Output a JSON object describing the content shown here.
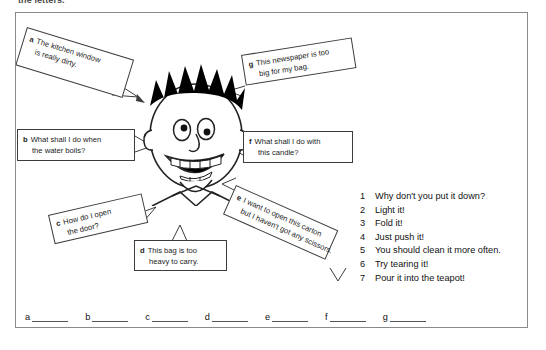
{
  "worksheet": {
    "top_instruction": "the letters.",
    "bubbles": [
      {
        "tag": "a",
        "line1": "The kitchen window",
        "line2": "is really dirty."
      },
      {
        "tag": "b",
        "line1": "What shall I do when",
        "line2": "the water boils?"
      },
      {
        "tag": "c",
        "line1": "How do I open",
        "line2": "the door?"
      },
      {
        "tag": "d",
        "line1": "This bag is too",
        "line2": "heavy to carry."
      },
      {
        "tag": "e",
        "line1": "I want to open this carton",
        "line2": "but I haven't got any scissors."
      },
      {
        "tag": "f",
        "line1": "What shall I do with",
        "line2": "this candle?"
      },
      {
        "tag": "g",
        "line1": "This newspaper is too",
        "line2": "big for my bag."
      }
    ],
    "answers": [
      {
        "num": "1",
        "text": "Why don't you put it down?"
      },
      {
        "num": "2",
        "text": "Light it!"
      },
      {
        "num": "3",
        "text": "Fold it!"
      },
      {
        "num": "4",
        "text": "Just push it!"
      },
      {
        "num": "5",
        "text": "You should clean it more often."
      },
      {
        "num": "6",
        "text": "Try tearing it!"
      },
      {
        "num": "7",
        "text": "Pour it into the teapot!"
      }
    ],
    "blanks": [
      "a",
      "b",
      "c",
      "d",
      "e",
      "f",
      "g"
    ],
    "colors": {
      "ink": "#1a1a1a",
      "frame": "#8a8a8a",
      "bubble_border": "#3c3c3c",
      "hair": "#000000",
      "paper": "#ffffff"
    },
    "illustration": {
      "name": "cartoon-boy-head",
      "features": [
        "spiky-black-hair",
        "two-eyes",
        "nose",
        "open-smiling-mouth-with-teeth",
        "ears",
        "chin",
        "neck-collar"
      ]
    }
  }
}
